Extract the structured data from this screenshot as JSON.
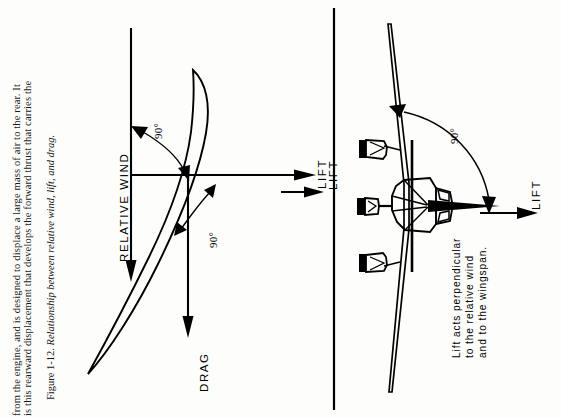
{
  "page": {
    "background_color": "#fdfdfb",
    "ink_color": "#000000",
    "orientation_note": "page-rotated-90-ccw"
  },
  "body_text": {
    "line1": "from the engine, and is designed to displace a large mass of air to the rear. It",
    "line2": "is this rearward displacement that develops the forward thrust that carries the"
  },
  "caption": {
    "number": "Figure 1-12.",
    "title": "Relationship between relative wind, lift, and drag."
  },
  "left_diagram": {
    "name": "airfoil-side-view",
    "labels": {
      "relative_wind": "RELATIVE  WIND",
      "lift": "LIFT",
      "drag": "DRAG",
      "angle_upper": "90°",
      "angle_lower": "90°"
    }
  },
  "right_diagram": {
    "name": "aircraft-front-view",
    "labels": {
      "lift_left": "LIFT",
      "lift_right": "LIFT",
      "angle": "90°"
    },
    "note_lines": [
      "Lift acts perpendicular",
      "to the relative wind",
      "and to the wingspan."
    ]
  }
}
